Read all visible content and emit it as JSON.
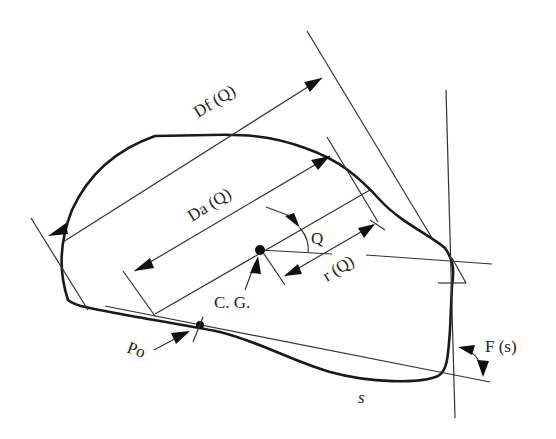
{
  "diagram": {
    "type": "particle-shape-descriptors",
    "labels": {
      "feret_diameter": "Df (Q)",
      "axial_diameter": "Da (Q)",
      "angle": "Q",
      "radius": "r (Q)",
      "centroid": "C. G.",
      "start_point": "Po",
      "perimeter_arc": "s",
      "tangent_angle": "F (s)"
    },
    "colors": {
      "background": "#ffffff",
      "outline": "#1a1a1a",
      "lines": "#333333",
      "text": "#222222"
    }
  }
}
